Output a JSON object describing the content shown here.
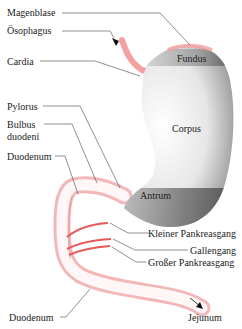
{
  "diagram": {
    "labels": {
      "magenblase": "Magenblase",
      "oesophagus": "Ösophagus",
      "cardia": "Cardia",
      "fundus": "Fundus",
      "pylorus": "Pylorus",
      "bulbus_1": "Bulbus",
      "bulbus_2": "duodeni",
      "corpus": "Corpus",
      "duodenum_top": "Duodenum",
      "antrum": "Antrum",
      "kleiner_pankreasgang": "Kleiner Pankreasgang",
      "gallengang": "Gallengang",
      "grosser_pankreasgang": "Großer Pankreasgang",
      "duodenum_bottom": "Duodenum",
      "jejunum": "Jejunum"
    },
    "colors": {
      "mucosa_pink": "#f08a8a",
      "duct_red": "#e85a5a",
      "stomach_gray": "#c8c8c8",
      "band_dark": "#555555"
    }
  }
}
